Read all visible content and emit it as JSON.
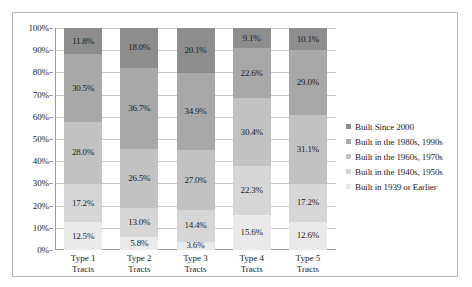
{
  "chart_data": {
    "type": "bar",
    "subtype": "stacked-percentage",
    "title": "",
    "subtitle": "",
    "xlabel": "",
    "ylabel": "",
    "ylim": [
      0,
      100
    ],
    "grid": true,
    "legend_position": "right",
    "categories": [
      "Type 1 Tracts",
      "Type 2 Tracts",
      "Type 3 Tracts",
      "Type 4 Tracts",
      "Type 5 Tracts"
    ],
    "category_lines": [
      [
        "Type 1",
        "Tracts"
      ],
      [
        "Type 2",
        "Tracts"
      ],
      [
        "Type 3",
        "Tracts"
      ],
      [
        "Type 4",
        "Tracts"
      ],
      [
        "Type 5",
        "Tracts"
      ]
    ],
    "y_ticks": [
      "0%",
      "10%",
      "20%",
      "30%",
      "40%",
      "50%",
      "60%",
      "70%",
      "80%",
      "90%",
      "100%"
    ],
    "y_tick_values": [
      0,
      10,
      20,
      30,
      40,
      50,
      60,
      70,
      80,
      90,
      100
    ],
    "series": [
      {
        "name": "Built Since 2000",
        "color": "#8d8d8d",
        "values": [
          11.8,
          18.0,
          20.1,
          9.1,
          10.1
        ],
        "labels": [
          "11.8%",
          "18.0%",
          "20.1%",
          "9.1%",
          "10.1%"
        ]
      },
      {
        "name": "Built in the 1980s, 1990s",
        "color": "#a8a8a8",
        "values": [
          30.5,
          36.7,
          34.9,
          22.6,
          29.0
        ],
        "labels": [
          "30.5%",
          "36.7%",
          "34.9%",
          "22.6%",
          "29.0%"
        ]
      },
      {
        "name": "Built in the 1960s, 1970s",
        "color": "#c2c2c2",
        "values": [
          28.0,
          26.5,
          27.0,
          30.4,
          31.1
        ],
        "labels": [
          "28.0%",
          "26.5%",
          "27.0%",
          "30.4%",
          "31.1%"
        ]
      },
      {
        "name": "Built in the 1940s, 1950s",
        "color": "#d6d6d6",
        "values": [
          17.2,
          13.0,
          14.4,
          22.3,
          17.2
        ],
        "labels": [
          "17.2%",
          "13.0%",
          "14.4%",
          "22.3%",
          "17.2%"
        ]
      },
      {
        "name": "Built in 1939 or Earlier",
        "color": "#eaeaea",
        "values": [
          12.5,
          5.8,
          3.6,
          15.6,
          12.6
        ],
        "labels": [
          "12.5%",
          "5.8%",
          "3.6%",
          "15.6%",
          "12.6%"
        ]
      }
    ]
  },
  "legend": {
    "items": [
      {
        "label": "Built Since 2000",
        "color": "#8d8d8d"
      },
      {
        "label": "Built in the 1980s, 1990s",
        "color": "#a8a8a8"
      },
      {
        "label": "Built in the 1960s, 1970s",
        "color": "#c2c2c2"
      },
      {
        "label": "Built in the 1940s, 1950s",
        "color": "#d6d6d6"
      },
      {
        "label": "Built in 1939 or Earlier",
        "color": "#eaeaea"
      }
    ]
  },
  "style": {
    "frame_border_color": "#b9b9b9",
    "gridline_color": "#c8c8c8",
    "axis_color": "#9a9a9a",
    "text_color": "#1c1c1c",
    "background": "#ffffff"
  }
}
